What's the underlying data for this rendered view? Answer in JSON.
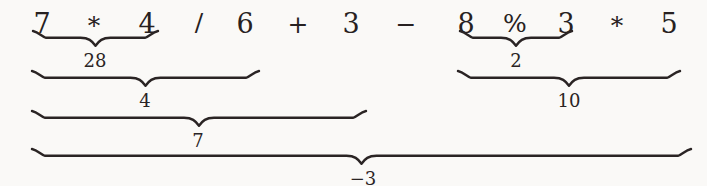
{
  "figure": {
    "kind": "expression-evaluation-diagram",
    "background_color": "#faf9f7",
    "ink_color": "#272121",
    "expression_text": "7 * 4 / 6 + 3 - 8 % 3 * 5",
    "final_result": "-3"
  },
  "expression": {
    "tokens": [
      {
        "id": "t0",
        "text": "7",
        "type": "number",
        "x": 42,
        "y": 10
      },
      {
        "id": "t1",
        "text": "*",
        "type": "operator",
        "x": 94,
        "y": 13
      },
      {
        "id": "t2",
        "text": "4",
        "type": "number",
        "x": 147,
        "y": 10
      },
      {
        "id": "t3",
        "text": "/",
        "type": "operator",
        "x": 199,
        "y": 10
      },
      {
        "id": "t4",
        "text": "6",
        "type": "number",
        "x": 245,
        "y": 10
      },
      {
        "id": "t5",
        "text": "+",
        "type": "operator",
        "x": 298,
        "y": 12
      },
      {
        "id": "t6",
        "text": "3",
        "type": "number",
        "x": 351,
        "y": 10
      },
      {
        "id": "t7",
        "text": "−",
        "type": "operator",
        "x": 406,
        "y": 12
      },
      {
        "id": "t8",
        "text": "8",
        "type": "number",
        "x": 466,
        "y": 10
      },
      {
        "id": "t9",
        "text": "%",
        "type": "operator",
        "x": 515,
        "y": 11
      },
      {
        "id": "t10",
        "text": "3",
        "type": "number",
        "x": 566,
        "y": 10
      },
      {
        "id": "t11",
        "text": "*",
        "type": "operator",
        "x": 617,
        "y": 13
      },
      {
        "id": "t12",
        "text": "5",
        "type": "number",
        "x": 669,
        "y": 10
      }
    ]
  },
  "braces": [
    {
      "id": "brace-1",
      "covers": "7 * 4",
      "result": "28",
      "left": 33,
      "right": 158,
      "top": 31,
      "depth": 11,
      "label_x": 95,
      "label_y": 52
    },
    {
      "id": "brace-2",
      "covers": "7 * 4 / 6",
      "result": "4",
      "left": 32,
      "right": 259,
      "top": 71,
      "depth": 11,
      "label_x": 145,
      "label_y": 92
    },
    {
      "id": "brace-3",
      "covers": "7 * 4 / 6 + 3",
      "result": "7",
      "left": 32,
      "right": 366,
      "top": 111,
      "depth": 11,
      "label_x": 198,
      "label_y": 132
    },
    {
      "id": "brace-4",
      "covers": "8 % 3",
      "result": "2",
      "left": 460,
      "right": 572,
      "top": 31,
      "depth": 11,
      "label_x": 516,
      "label_y": 52
    },
    {
      "id": "brace-5",
      "covers": "8 % 3 * 5",
      "result": "10",
      "left": 458,
      "right": 680,
      "top": 71,
      "depth": 11,
      "label_x": 569,
      "label_y": 92
    },
    {
      "id": "brace-6",
      "covers": "7 * 4 / 6 + 3 - 8 % 3 * 5",
      "result": "−3",
      "left": 32,
      "right": 691,
      "top": 149,
      "depth": 11,
      "label_x": 363,
      "label_y": 170
    }
  ]
}
